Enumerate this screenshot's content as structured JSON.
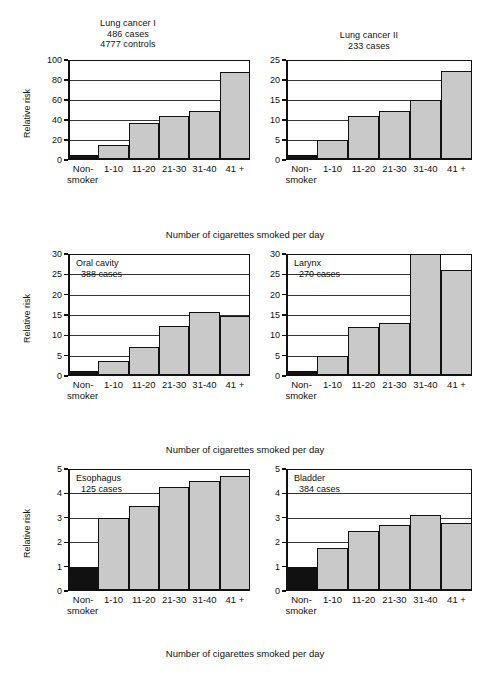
{
  "figure": {
    "xaxis_caption": "Number of cigarettes smoked per day",
    "ylabel": "Relative risk",
    "categories": [
      "Non-smoker",
      "1-10",
      "11-20",
      "21-30",
      "31-40",
      "41 +"
    ],
    "nonsmoker_line1": "Non-",
    "nonsmoker_line2": "smoker"
  },
  "chart_data": [
    {
      "type": "bar",
      "id": "lung-cancer-1",
      "title": "Lung cancer I",
      "subtitle_lines": [
        "486 cases",
        "4777 controls"
      ],
      "cases": "486 cases",
      "controls": "4777 controls",
      "title_position": "above",
      "xlabel": "Number of cigarettes smoked per day",
      "ylabel": "Relative risk",
      "categories": [
        "Non-smoker",
        "1-10",
        "11-20",
        "21-30",
        "31-40",
        "41 +"
      ],
      "values": [
        5,
        15,
        37,
        44,
        49,
        88
      ],
      "ylim": [
        0,
        100
      ],
      "yticks": [
        0,
        20,
        40,
        60,
        80,
        100
      ],
      "grid": true,
      "reference_bar_index": 0
    },
    {
      "type": "bar",
      "id": "lung-cancer-2",
      "title": "Lung cancer II",
      "subtitle_lines": [
        "233 cases"
      ],
      "cases": "233 cases",
      "title_position": "above",
      "xlabel": "Number of cigarettes smoked per day",
      "ylabel": "Relative risk",
      "categories": [
        "Non-smoker",
        "1-10",
        "11-20",
        "21-30",
        "31-40",
        "41 +"
      ],
      "values": [
        1.2,
        5.1,
        11,
        12.2,
        15,
        22.3
      ],
      "ylim": [
        0,
        25
      ],
      "yticks": [
        0,
        5,
        10,
        15,
        20,
        25
      ],
      "grid": true,
      "reference_bar_index": 0
    },
    {
      "type": "bar",
      "id": "oral-cavity",
      "title": "Oral cavity",
      "subtitle_lines": [
        "388 cases"
      ],
      "cases": "388 cases",
      "title_position": "inside",
      "xlabel": "Number of cigarettes smoked per day",
      "ylabel": "Relative risk",
      "categories": [
        "Non-smoker",
        "1-10",
        "11-20",
        "21-30",
        "31-40",
        "41 +"
      ],
      "values": [
        1.3,
        3.7,
        7.2,
        12.3,
        15.8,
        14.7
      ],
      "ylim": [
        0,
        30
      ],
      "yticks": [
        0,
        5,
        10,
        15,
        20,
        25,
        30
      ],
      "grid": true,
      "reference_bar_index": 0
    },
    {
      "type": "bar",
      "id": "larynx",
      "title": "Larynx",
      "subtitle_lines": [
        "270 cases"
      ],
      "cases": "270 cases",
      "title_position": "inside",
      "xlabel": "Number of cigarettes smoked per day",
      "ylabel": "Relative risk",
      "categories": [
        "Non-smoker",
        "1-10",
        "11-20",
        "21-30",
        "31-40",
        "41 +"
      ],
      "values": [
        1.2,
        5,
        12,
        13,
        30,
        26
      ],
      "ylim": [
        0,
        30
      ],
      "yticks": [
        0,
        5,
        10,
        15,
        20,
        25,
        30
      ],
      "grid": true,
      "reference_bar_index": 0,
      "note": "31-40 bar reaches the top of the axis (>= 30)"
    },
    {
      "type": "bar",
      "id": "esophagus",
      "title": "Esophagus",
      "subtitle_lines": [
        "125 cases"
      ],
      "cases": "125 cases",
      "title_position": "inside",
      "xlabel": "Number of cigarettes smoked per day",
      "ylabel": "Relative risk",
      "categories": [
        "Non-smoker",
        "1-10",
        "11-20",
        "21-30",
        "31-40",
        "41 +"
      ],
      "values": [
        1,
        3,
        3.5,
        4.25,
        4.5,
        4.7
      ],
      "ylim": [
        0,
        5
      ],
      "yticks": [
        0,
        1,
        2,
        3,
        4,
        5
      ],
      "grid": true,
      "reference_bar_index": 0
    },
    {
      "type": "bar",
      "id": "bladder",
      "title": "Bladder",
      "subtitle_lines": [
        "384 cases"
      ],
      "cases": "384 cases",
      "title_position": "inside",
      "xlabel": "Number of cigarettes smoked per day",
      "ylabel": "Relative risk",
      "categories": [
        "Non-smoker",
        "1-10",
        "11-20",
        "21-30",
        "31-40",
        "41 +"
      ],
      "values": [
        1,
        1.75,
        2.45,
        2.7,
        3.1,
        2.8
      ],
      "ylim": [
        0,
        5
      ],
      "yticks": [
        0,
        1,
        2,
        3,
        4,
        5
      ],
      "grid": true,
      "reference_bar_index": 0
    }
  ],
  "colors": {
    "bar_shaded": "#c9c9c9",
    "bar_reference": "#111111",
    "axis": "#111111",
    "background": "#ffffff"
  }
}
